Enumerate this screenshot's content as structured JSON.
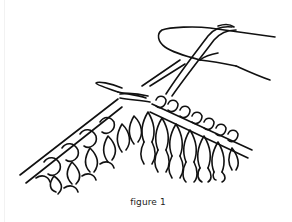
{
  "figure": {
    "caption": "figure 1",
    "illustration": "knitting-needle-with-stitches-and-yarn-over-finger-icon",
    "colors": {
      "ink": "#111111",
      "background": "#ffffff"
    }
  }
}
